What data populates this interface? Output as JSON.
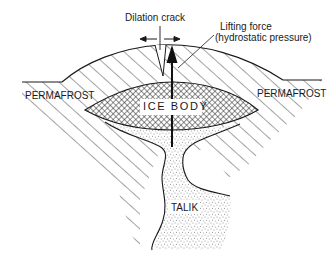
{
  "diagram": {
    "type": "cross-section",
    "labels": {
      "dilation_crack": "Dilation crack",
      "lifting_force_line1": "Lifting force",
      "lifting_force_line2": "(hydrostatic pressure)",
      "permafrost_left": "PERMAFROST",
      "permafrost_right": "PERMAFROST",
      "ice_body": "ICE BODY",
      "talik": "TALIK"
    },
    "legend_patterns": {
      "permafrost": "diagonal-hatch",
      "ice_body": "cross-hatch",
      "talik": "stipple"
    },
    "colors": {
      "ink": "#1a1a1a",
      "background": "#ffffff"
    }
  }
}
